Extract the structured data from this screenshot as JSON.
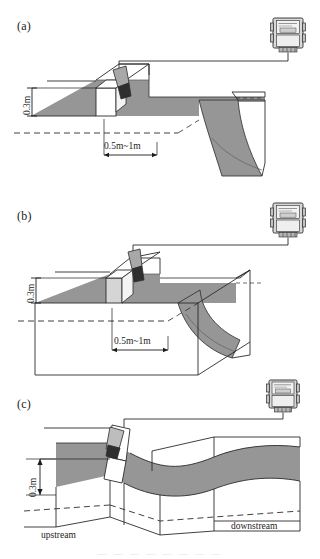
{
  "figure": {
    "title_fragment": "",
    "water_color": "#969696",
    "water_color_light": "#c9c9c9",
    "line_color": "#2b2b2b",
    "sensor_body_color": "#a8a8a8",
    "sensor_cone_color": "#2e2e2e",
    "meter_case_color": "#d8d8d8"
  },
  "panels": [
    {
      "id": "a",
      "label": "(a)",
      "dimensions": [
        {
          "name": "head-height",
          "value": "0.3m",
          "orientation": "vertical"
        },
        {
          "name": "sensor-distance",
          "value": "0.5m~1m",
          "orientation": "horizontal"
        }
      ],
      "meter": {
        "name": "ultrasonic-flow-transmitter",
        "display_lines": [
          "———",
          "——"
        ],
        "readout": "88.8"
      },
      "sensor": {
        "name": "ultrasonic-level-sensor"
      },
      "edge_labels": []
    },
    {
      "id": "b",
      "label": "(b)",
      "dimensions": [
        {
          "name": "head-height",
          "value": "0.3m",
          "orientation": "vertical"
        },
        {
          "name": "sensor-distance",
          "value": "0.5m~1m",
          "orientation": "horizontal"
        }
      ],
      "meter": {
        "name": "ultrasonic-flow-transmitter",
        "display_lines": [
          "———",
          "——"
        ],
        "readout": "88.8"
      },
      "sensor": {
        "name": "ultrasonic-level-sensor"
      },
      "edge_labels": []
    },
    {
      "id": "c",
      "label": "(c)",
      "dimensions": [
        {
          "name": "head-height",
          "value": "0.3m",
          "orientation": "vertical"
        }
      ],
      "meter": {
        "name": "ultrasonic-flow-transmitter",
        "display_lines": [
          "———",
          "——"
        ],
        "readout": "88.8"
      },
      "sensor": {
        "name": "ultrasonic-level-sensor"
      },
      "edge_labels": [
        {
          "name": "upstream-label",
          "value": "upstream"
        },
        {
          "name": "downstream-label",
          "value": "downstream"
        }
      ]
    }
  ],
  "caption_fragment": "— — — — — — — —"
}
